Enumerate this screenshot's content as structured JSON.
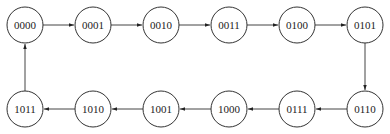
{
  "diagram": {
    "type": "state-transition-cycle",
    "colors": {
      "stroke": "#333333",
      "text": "#222222",
      "background": "#ffffff"
    },
    "nodes": [
      {
        "id": "s0",
        "label": "0000",
        "x": 25,
        "y": 25
      },
      {
        "id": "s1",
        "label": "0001",
        "x": 93,
        "y": 25
      },
      {
        "id": "s2",
        "label": "0010",
        "x": 161,
        "y": 25
      },
      {
        "id": "s3",
        "label": "0011",
        "x": 229,
        "y": 25
      },
      {
        "id": "s4",
        "label": "0100",
        "x": 297,
        "y": 25
      },
      {
        "id": "s5",
        "label": "0101",
        "x": 365,
        "y": 25
      },
      {
        "id": "s6",
        "label": "0110",
        "x": 365,
        "y": 109
      },
      {
        "id": "s7",
        "label": "0111",
        "x": 297,
        "y": 109
      },
      {
        "id": "s8",
        "label": "1000",
        "x": 229,
        "y": 109
      },
      {
        "id": "s9",
        "label": "1001",
        "x": 161,
        "y": 109
      },
      {
        "id": "s10",
        "label": "1010",
        "x": 93,
        "y": 109
      },
      {
        "id": "s11",
        "label": "1011",
        "x": 25,
        "y": 109
      }
    ],
    "edges": [
      {
        "from": "s0",
        "to": "s1"
      },
      {
        "from": "s1",
        "to": "s2"
      },
      {
        "from": "s2",
        "to": "s3"
      },
      {
        "from": "s3",
        "to": "s4"
      },
      {
        "from": "s4",
        "to": "s5"
      },
      {
        "from": "s5",
        "to": "s6"
      },
      {
        "from": "s6",
        "to": "s7"
      },
      {
        "from": "s7",
        "to": "s8"
      },
      {
        "from": "s8",
        "to": "s9"
      },
      {
        "from": "s9",
        "to": "s10"
      },
      {
        "from": "s10",
        "to": "s11"
      },
      {
        "from": "s11",
        "to": "s0"
      }
    ],
    "radius": 18
  }
}
